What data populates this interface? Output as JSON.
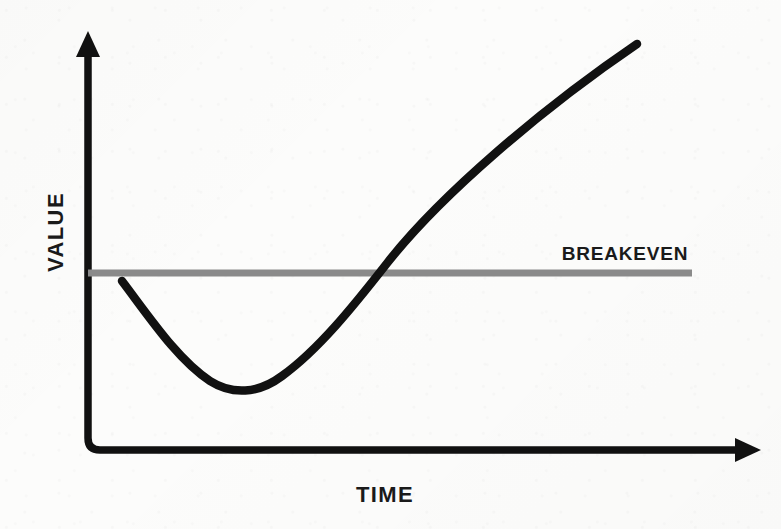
{
  "chart_data": {
    "type": "line",
    "title": "",
    "subtitle": "",
    "xlabel": "TIME",
    "ylabel": "VALUE",
    "xlim": [
      0,
      100
    ],
    "ylim": [
      0,
      100
    ],
    "grid": false,
    "axis_ticks": {
      "x": [],
      "y": []
    },
    "legend": {
      "position": "inline-right",
      "entries": [
        {
          "name": "BREAKEVEN",
          "color": "#8a8a8a"
        }
      ]
    },
    "annotations": [
      {
        "name": "breakeven-label",
        "text": "BREAKEVEN",
        "x": 89.5,
        "y": 55.5
      }
    ],
    "series": [
      {
        "name": "Value curve (J-curve)",
        "type": "line",
        "color": "#111111",
        "linewidth": 8,
        "description": "Value dips below breakeven, bottoms out, then rises steeply past breakeven",
        "points": [
          {
            "x": 5.5,
            "y": 52.0
          },
          {
            "x": 10.0,
            "y": 44.0
          },
          {
            "x": 15.0,
            "y": 36.0
          },
          {
            "x": 21.5,
            "y": 28.5
          },
          {
            "x": 30.0,
            "y": 23.5
          },
          {
            "x": 38.0,
            "y": 25.5
          },
          {
            "x": 46.0,
            "y": 32.0
          },
          {
            "x": 54.0,
            "y": 41.0
          },
          {
            "x": 60.5,
            "y": 50.0
          },
          {
            "x": 66.5,
            "y": 58.5
          },
          {
            "x": 74.0,
            "y": 69.0
          },
          {
            "x": 81.0,
            "y": 79.5
          },
          {
            "x": 88.0,
            "y": 90.0
          },
          {
            "x": 94.0,
            "y": 97.5
          }
        ],
        "key_points": {
          "start": {
            "x": 5.5,
            "y": 52.0,
            "label": "Initial value"
          },
          "minimum": {
            "x": 30.0,
            "y": 23.5,
            "label": "Trough / maximum loss"
          },
          "breakeven_crossing": {
            "x": 60.5,
            "y": 50.0,
            "label": "Breakeven crossing"
          },
          "end": {
            "x": 94.0,
            "y": 97.5,
            "label": "End of horizon"
          }
        }
      },
      {
        "name": "BREAKEVEN",
        "type": "reference-line",
        "orientation": "horizontal",
        "color": "#8a8a8a",
        "linewidth": 7,
        "y": 50.0,
        "x_start": 0.0,
        "x_end": 89.5
      }
    ]
  },
  "geometry": {
    "canvas": {
      "width": 781,
      "height": 529
    },
    "axis": {
      "color": "#111111",
      "linewidth": 7.5,
      "origin": {
        "x": 88,
        "y": 450
      },
      "y_axis_top": {
        "x": 88,
        "y": 40
      },
      "x_axis_right": {
        "x": 752,
        "y": 450
      },
      "corner_radius": 12,
      "arrow_size": 13
    },
    "breakeven_line": {
      "color": "#8a8a8a",
      "linewidth": 7,
      "y": 273,
      "x_start": 88,
      "x_end": 692
    },
    "curve": {
      "color": "#111111",
      "linewidth": 8.5,
      "path": "M122,281 C150,318 178,360 210,381 C232,395 258,394 282,376 C318,350 352,308 388,262 C440,196 540,110 637,44"
    }
  },
  "labels": {
    "y_axis": "VALUE",
    "x_axis": "TIME",
    "breakeven": "BREAKEVEN"
  },
  "colors": {
    "background": "#fcfcfb",
    "ink": "#111111",
    "text": "#1a1a1a",
    "breakeven_gray": "#8a8a8a"
  }
}
